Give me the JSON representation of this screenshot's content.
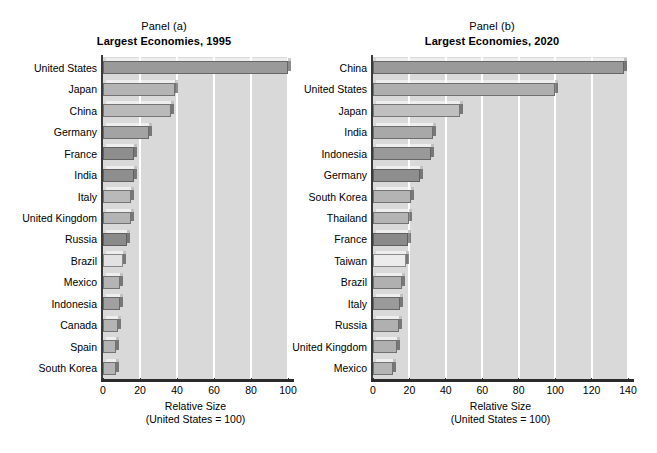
{
  "figure": {
    "background": "#ffffff",
    "plot_background": "#d9d9d9",
    "gridline_color": "#ffffff",
    "axis_color": "#2b2b2b"
  },
  "panels": [
    {
      "id": "panel-a",
      "supertitle": "Panel (a)",
      "title": "Largest Economies, 1995",
      "xlabel_line1": "Relative Size",
      "xlabel_line2": "(United States = 100)"
    },
    {
      "id": "panel-b",
      "supertitle": "Panel (b)",
      "title": "Largest Economies, 2020",
      "xlabel_line1": "Relative Size",
      "xlabel_line2": "(United States = 100)"
    }
  ],
  "chart_data": [
    {
      "type": "bar",
      "orientation": "horizontal",
      "title": "Largest Economies, 1995",
      "supertitle": "Panel (a)",
      "xlabel": "Relative Size (United States = 100)",
      "ylabel": "",
      "xlim": [
        0,
        100
      ],
      "xticks": [
        0,
        20,
        40,
        60,
        80,
        100
      ],
      "grid": "vertical",
      "legend": "none",
      "categories": [
        "United States",
        "Japan",
        "China",
        "Germany",
        "France",
        "India",
        "Italy",
        "United Kingdom",
        "Russia",
        "Brazil",
        "Mexico",
        "Indonesia",
        "Canada",
        "Spain",
        "South Korea"
      ],
      "values": [
        100,
        39,
        37,
        25,
        17,
        17,
        15,
        15,
        13,
        11,
        9,
        9,
        8,
        7,
        7
      ],
      "bar_colors": [
        "#9a9a9a",
        "#b4b4b4",
        "#b9b9b9",
        "#a3a3a3",
        "#8e8e8e",
        "#8e8e8e",
        "#b9b9b9",
        "#b4b4b4",
        "#8a8a8a",
        "#e2e2e2",
        "#b4b4b4",
        "#a0a0a0",
        "#b4b4b4",
        "#b4b4b4",
        "#b4b4b4"
      ]
    },
    {
      "type": "bar",
      "orientation": "horizontal",
      "title": "Largest Economies, 2020",
      "supertitle": "Panel (b)",
      "xlabel": "Relative Size (United States = 100)",
      "ylabel": "",
      "xlim": [
        0,
        140
      ],
      "xticks": [
        0,
        20,
        40,
        60,
        80,
        100,
        120,
        140
      ],
      "grid": "vertical",
      "legend": "none",
      "categories": [
        "China",
        "United States",
        "Japan",
        "India",
        "Indonesia",
        "Germany",
        "South Korea",
        "Thailand",
        "France",
        "Taiwan",
        "Brazil",
        "Italy",
        "Russia",
        "United Kingdom",
        "Mexico"
      ],
      "values": [
        138,
        100,
        48,
        33,
        32,
        26,
        21,
        20,
        19,
        18,
        16,
        15,
        14,
        13,
        11
      ],
      "bar_colors": [
        "#9a9a9a",
        "#aeaeae",
        "#bfbfbf",
        "#a8a8a8",
        "#999999",
        "#8e8e8e",
        "#b4b4b4",
        "#b4b4b4",
        "#8a8a8a",
        "#ececec",
        "#b0b0b0",
        "#9a9a9a",
        "#b0b0b0",
        "#b0b0b0",
        "#b4b4b4"
      ]
    }
  ]
}
